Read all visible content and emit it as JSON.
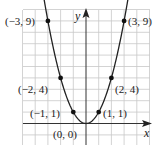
{
  "chart_data": {
    "type": "line",
    "title": "",
    "function": "y = x^2",
    "xlabel": "x",
    "ylabel": "y",
    "xlim": [
      -5,
      5
    ],
    "ylim": [
      -2,
      10
    ],
    "grid": true,
    "legend": null,
    "series": [
      {
        "name": "y = x^2",
        "points": [
          {
            "x": -3,
            "y": 9,
            "label": "(−3, 9)"
          },
          {
            "x": -2,
            "y": 4,
            "label": "(−2, 4)"
          },
          {
            "x": -1,
            "y": 1,
            "label": "(−1, 1)"
          },
          {
            "x": 0,
            "y": 0,
            "label": "(0, 0)"
          },
          {
            "x": 1,
            "y": 1,
            "label": "(1, 1)"
          },
          {
            "x": 2,
            "y": 4,
            "label": "(2, 4)"
          },
          {
            "x": 3,
            "y": 9,
            "label": "(3, 9)"
          }
        ]
      }
    ]
  },
  "labels": {
    "x_axis": "x",
    "y_axis": "y",
    "p_m3": "(−3, 9)",
    "p_m2": "(−2, 4)",
    "p_m1": "(−1, 1)",
    "p_0": "(0, 0)",
    "p_1": "(1, 1)",
    "p_2": "(2, 4)",
    "p_3": "(3, 9)"
  },
  "colors": {
    "grid": "#c8c8c8",
    "axis": "#333333",
    "curve": "#222222",
    "point": "#111111"
  }
}
